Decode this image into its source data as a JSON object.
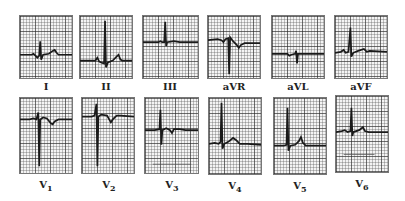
{
  "figure": {
    "rows": [
      {
        "leads": [
          {
            "id": "I",
            "label": "I",
            "sub": ""
          },
          {
            "id": "II",
            "label": "II",
            "sub": ""
          },
          {
            "id": "III",
            "label": "III",
            "sub": ""
          },
          {
            "id": "aVR",
            "label": "aVR",
            "sub": ""
          },
          {
            "id": "aVL",
            "label": "aVL",
            "sub": ""
          },
          {
            "id": "aVF",
            "label": "aVF",
            "sub": ""
          }
        ]
      },
      {
        "leads": [
          {
            "id": "V1",
            "label": "V",
            "sub": "1"
          },
          {
            "id": "V2",
            "label": "V",
            "sub": "2"
          },
          {
            "id": "V3",
            "label": "V",
            "sub": "3"
          },
          {
            "id": "V4",
            "label": "V",
            "sub": "4"
          },
          {
            "id": "V5",
            "label": "V",
            "sub": "5"
          },
          {
            "id": "V6",
            "label": "V",
            "sub": "6"
          }
        ]
      }
    ]
  },
  "colors": {
    "trace": "#1a1a1a",
    "grid_bg": "#f4f4f4",
    "label": "#222222"
  }
}
